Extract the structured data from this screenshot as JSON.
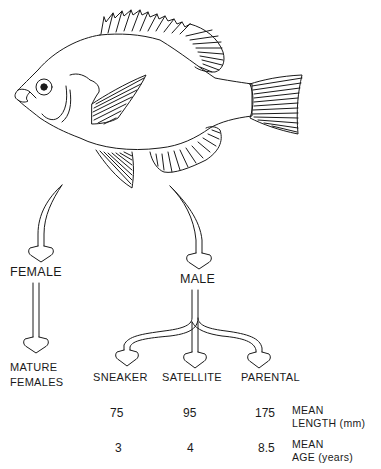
{
  "diagram": {
    "branches": {
      "female": {
        "label": "FEMALE",
        "outcome": "MATURE\nFEMALES",
        "outcome_lines": [
          "MATURE",
          "FEMALES"
        ]
      },
      "male": {
        "label": "MALE",
        "types": [
          {
            "label": "SNEAKER",
            "mean_length_mm": "75",
            "mean_age_years": "3"
          },
          {
            "label": "SATELLITE",
            "mean_length_mm": "95",
            "mean_age_years": "4"
          },
          {
            "label": "PARENTAL",
            "mean_length_mm": "175",
            "mean_age_years": "8.5"
          }
        ]
      }
    },
    "row_labels": {
      "length": [
        "MEAN",
        "LENGTH (mm)"
      ],
      "age": [
        "MEAN",
        "AGE (years)"
      ]
    },
    "colors": {
      "ink": "#1a1a1a",
      "background": "#ffffff"
    }
  }
}
